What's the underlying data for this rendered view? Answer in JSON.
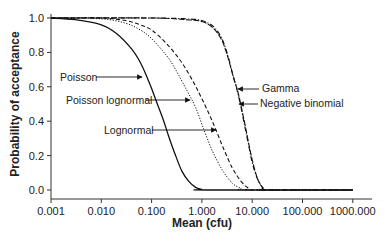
{
  "chart_data": {
    "type": "line",
    "title": "",
    "xlabel": "Mean (cfu)",
    "ylabel": "Probability of acceptance",
    "xscale": "log",
    "xlim": [
      0.001,
      1000
    ],
    "ylim": [
      0.0,
      1.0
    ],
    "grid": false,
    "legend_position": "inline annotations with arrows",
    "x_ticks": [
      "0.001",
      "0.010",
      "0.100",
      "1.000",
      "10.000",
      "100.000",
      "1000.000"
    ],
    "y_ticks": [
      "0.0",
      "0.2",
      "0.4",
      "0.6",
      "0.8",
      "1.0"
    ],
    "series": [
      {
        "name": "Poisson",
        "style": "solid",
        "points": [
          [
            0.001,
            1.0
          ],
          [
            0.003,
            0.99
          ],
          [
            0.01,
            0.96
          ],
          [
            0.02,
            0.91
          ],
          [
            0.04,
            0.82
          ],
          [
            0.06,
            0.74
          ],
          [
            0.08,
            0.66
          ],
          [
            0.1,
            0.59
          ],
          [
            0.13,
            0.5
          ],
          [
            0.17,
            0.41
          ],
          [
            0.22,
            0.31
          ],
          [
            0.3,
            0.2
          ],
          [
            0.4,
            0.11
          ],
          [
            0.55,
            0.05
          ],
          [
            0.75,
            0.015
          ],
          [
            1.0,
            0.003
          ],
          [
            1.2,
            0.0
          ],
          [
            1000,
            0.0
          ]
        ]
      },
      {
        "name": "Poisson lognormal",
        "style": "dotted",
        "points": [
          [
            0.001,
            1.0
          ],
          [
            0.01,
            0.995
          ],
          [
            0.03,
            0.97
          ],
          [
            0.06,
            0.93
          ],
          [
            0.1,
            0.88
          ],
          [
            0.2,
            0.78
          ],
          [
            0.3,
            0.7
          ],
          [
            0.5,
            0.58
          ],
          [
            0.75,
            0.48
          ],
          [
            1.1,
            0.35
          ],
          [
            1.6,
            0.23
          ],
          [
            2.5,
            0.12
          ],
          [
            4.0,
            0.04
          ],
          [
            6.0,
            0.01
          ],
          [
            8.0,
            0.0
          ],
          [
            1000,
            0.0
          ]
        ]
      },
      {
        "name": "Lognormal",
        "style": "dashed",
        "points": [
          [
            0.001,
            1.0
          ],
          [
            0.01,
            1.0
          ],
          [
            0.03,
            0.985
          ],
          [
            0.06,
            0.96
          ],
          [
            0.1,
            0.93
          ],
          [
            0.2,
            0.85
          ],
          [
            0.4,
            0.74
          ],
          [
            0.7,
            0.62
          ],
          [
            1.0,
            0.53
          ],
          [
            1.4,
            0.44
          ],
          [
            1.9,
            0.35
          ],
          [
            2.7,
            0.24
          ],
          [
            4.0,
            0.13
          ],
          [
            6.0,
            0.05
          ],
          [
            8.5,
            0.01
          ],
          [
            11.0,
            0.0
          ],
          [
            1000,
            0.0
          ]
        ]
      },
      {
        "name": "Gamma",
        "style": "dash-dot",
        "points": [
          [
            0.001,
            1.0
          ],
          [
            0.1,
            1.0
          ],
          [
            0.5,
            0.995
          ],
          [
            1.0,
            0.985
          ],
          [
            1.7,
            0.95
          ],
          [
            2.5,
            0.88
          ],
          [
            3.3,
            0.78
          ],
          [
            4.2,
            0.66
          ],
          [
            5.0,
            0.58
          ],
          [
            6.0,
            0.48
          ],
          [
            7.0,
            0.38
          ],
          [
            8.5,
            0.26
          ],
          [
            10.0,
            0.16
          ],
          [
            12.5,
            0.07
          ],
          [
            16.0,
            0.015
          ],
          [
            20.0,
            0.0
          ],
          [
            1000,
            0.0
          ]
        ]
      },
      {
        "name": "Negative binomial",
        "style": "long-dash",
        "points": [
          [
            0.001,
            1.0
          ],
          [
            0.1,
            1.0
          ],
          [
            0.5,
            0.99
          ],
          [
            1.0,
            0.98
          ],
          [
            1.7,
            0.94
          ],
          [
            2.5,
            0.87
          ],
          [
            3.3,
            0.77
          ],
          [
            4.2,
            0.66
          ],
          [
            5.2,
            0.57
          ],
          [
            6.2,
            0.47
          ],
          [
            7.3,
            0.37
          ],
          [
            8.8,
            0.25
          ],
          [
            10.5,
            0.15
          ],
          [
            13.0,
            0.06
          ],
          [
            16.5,
            0.012
          ],
          [
            20.0,
            0.0
          ],
          [
            1000,
            0.0
          ]
        ]
      }
    ],
    "annotations": [
      {
        "text": "Poisson",
        "arrow_to_series": "Poisson"
      },
      {
        "text": "Poisson lognormal",
        "arrow_to_series": "Poisson lognormal"
      },
      {
        "text": "Lognormal",
        "arrow_to_series": "Lognormal"
      },
      {
        "text": "Gamma",
        "arrow_to_series": "Gamma"
      },
      {
        "text": "Negative binomial",
        "arrow_to_series": "Negative binomial"
      }
    ]
  },
  "labels": {
    "xlabel": "Mean (cfu)",
    "ylabel": "Probability of acceptance",
    "poisson": "Poisson",
    "poisson_lognormal": "Poisson lognormal",
    "lognormal": "Lognormal",
    "gamma": "Gamma",
    "negative_binomial": "Negative binomial"
  }
}
